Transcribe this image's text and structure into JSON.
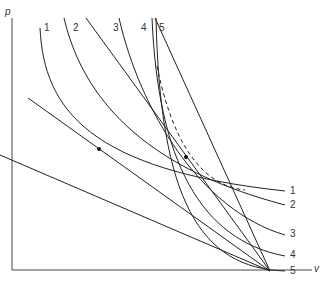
{
  "diagram": {
    "axes": {
      "y_label": "p",
      "x_label": "v"
    },
    "curve_labels_top": [
      "1",
      "2",
      "3",
      "4",
      "5"
    ],
    "curve_labels_right": [
      "1",
      "2",
      "3",
      "4",
      "5"
    ],
    "colors": {
      "line": "#222222",
      "axis": "#444444",
      "text": "#333333",
      "background": "#ffffff"
    },
    "curves": [
      {
        "id": "1",
        "path": "M 40 28 C 44 110, 90 170, 285 191"
      },
      {
        "id": "2",
        "path": "M 64 18 C 90 130, 190 180, 285 205"
      },
      {
        "id": "3",
        "path": "M 119 18 C 140 110, 200 210, 285 235"
      },
      {
        "id": "4",
        "path": "M 152 18 C 158 160, 200 240, 285 256"
      },
      {
        "id": "5",
        "path": "M 156 18 C 160 200, 200 268, 285 271"
      }
    ],
    "straight_lines": [
      {
        "id": "tangent-1",
        "x1": 28,
        "y1": 98,
        "x2": 270,
        "y2": 271
      },
      {
        "id": "line-a",
        "x1": 86,
        "y1": 18,
        "x2": 270,
        "y2": 271
      },
      {
        "id": "line-b",
        "x1": 155,
        "y1": 18,
        "x2": 270,
        "y2": 271
      },
      {
        "id": "line-c",
        "x1": 0,
        "y1": 155,
        "x2": 270,
        "y2": 271
      }
    ],
    "envelope": {
      "style": "dashed",
      "path": "M 157 66 C 170 130, 195 185, 245 190"
    },
    "points": [
      {
        "x": 99,
        "y": 149
      },
      {
        "x": 186,
        "y": 157
      }
    ]
  }
}
